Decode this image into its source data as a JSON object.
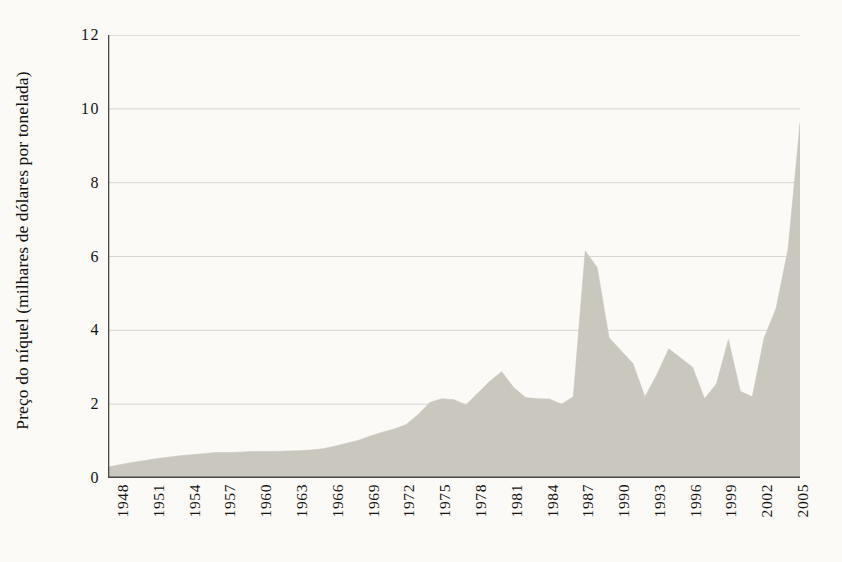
{
  "chart_data": {
    "type": "area",
    "title": "",
    "xlabel": "",
    "ylabel": "Preço do níquel (milhares de dólares por tonelada)",
    "ylim": [
      0,
      12
    ],
    "xlim": [
      1948,
      2006
    ],
    "ytick_labels": [
      "0",
      "2",
      "4",
      "6",
      "8",
      "10",
      "12"
    ],
    "ytick_values": [
      0,
      2,
      4,
      6,
      8,
      10,
      12
    ],
    "xtick_labels": [
      "1948",
      "1951",
      "1954",
      "1957",
      "1960",
      "1963",
      "1966",
      "1969",
      "1972",
      "1975",
      "1978",
      "1981",
      "1984",
      "1987",
      "1990",
      "1993",
      "1996",
      "1999",
      "2002",
      "2005"
    ],
    "xtick_values": [
      1948,
      1951,
      1954,
      1957,
      1960,
      1963,
      1966,
      1969,
      1972,
      1975,
      1978,
      1981,
      1984,
      1987,
      1990,
      1993,
      1996,
      1999,
      2002,
      2005
    ],
    "minor_xticks": "every year from 1948 to 2006",
    "grid": "horizontal only",
    "legend": "none",
    "series": [
      {
        "name": "Preço do níquel",
        "x": [
          1948,
          1949,
          1950,
          1951,
          1952,
          1953,
          1954,
          1955,
          1956,
          1957,
          1958,
          1959,
          1960,
          1961,
          1962,
          1963,
          1964,
          1965,
          1966,
          1967,
          1968,
          1969,
          1970,
          1971,
          1972,
          1973,
          1974,
          1975,
          1976,
          1977,
          1978,
          1979,
          1980,
          1981,
          1982,
          1983,
          1984,
          1985,
          1986,
          1987,
          1988,
          1989,
          1990,
          1991,
          1992,
          1993,
          1994,
          1995,
          1996,
          1997,
          1998,
          1999,
          2000,
          2001,
          2002,
          2003,
          2004,
          2005,
          2006
        ],
        "values": [
          0.3,
          0.36,
          0.42,
          0.47,
          0.52,
          0.56,
          0.6,
          0.63,
          0.66,
          0.69,
          0.69,
          0.7,
          0.72,
          0.72,
          0.72,
          0.73,
          0.74,
          0.76,
          0.79,
          0.86,
          0.94,
          1.02,
          1.14,
          1.24,
          1.33,
          1.45,
          1.72,
          2.05,
          2.15,
          2.12,
          1.98,
          2.3,
          2.62,
          2.88,
          2.45,
          2.18,
          2.15,
          2.14,
          2.0,
          2.2,
          6.15,
          5.7,
          3.8,
          3.45,
          3.1,
          2.2,
          2.8,
          3.5,
          3.25,
          3.0,
          2.15,
          2.55,
          3.75,
          2.35,
          2.2,
          3.8,
          4.6,
          6.2,
          9.6
        ]
      }
    ],
    "colors": {
      "fill": "#c9c7be",
      "background": "#fbfaf7",
      "axis": "#4a4944",
      "gridline": "#d7d6d0",
      "text": "#14120f"
    }
  },
  "axis": {
    "y_title": "Preço do níquel (milhares de dólares por tonelada)"
  }
}
